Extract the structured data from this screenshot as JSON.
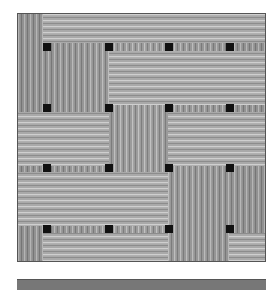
{
  "image": {
    "description": "grayscale woven basket texture",
    "grid_squares": 16,
    "colors": {
      "background": "#ffffff",
      "strip_light": "#b4b4b4",
      "strip_dark": "#7c7c7c",
      "knot": "#111111",
      "border": "#555555"
    }
  }
}
